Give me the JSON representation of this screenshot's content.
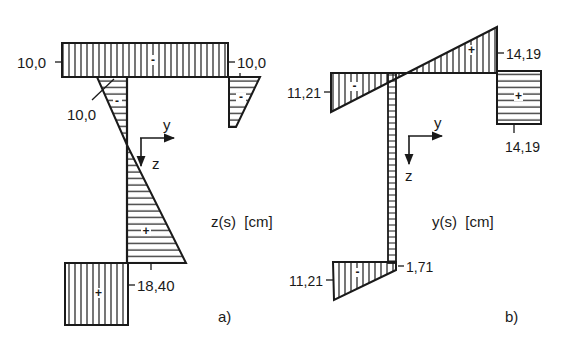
{
  "diagram_a": {
    "caption": "a)",
    "quantity_label": "z(s)  [cm]",
    "axes": {
      "y": "y",
      "z": "z"
    },
    "values": {
      "top_flange_left": "10,0",
      "top_flange_right": "10,0",
      "web_top": "10,0",
      "web_bottom": "18,40"
    },
    "signs": {
      "top_flange": "-",
      "web_top_triangle": "-",
      "right_lip": "-",
      "web_bottom_triangle": "+",
      "bottom_flange": "+"
    }
  },
  "diagram_b": {
    "caption": "b)",
    "quantity_label": "y(s)  [cm]",
    "axes": {
      "y": "y",
      "z": "z"
    },
    "values": {
      "top_flange_left": "11,21",
      "top_flange_right": "14,19",
      "right_lip_bottom": "14,19",
      "bottom_flange_left": "11,21",
      "bottom_flange_right": "1,71"
    },
    "signs": {
      "top_left_triangle": "-",
      "top_right_triangle": "+",
      "right_lip": "+",
      "bottom_flange": "-"
    }
  },
  "colors": {
    "ink": "#1a1a1a",
    "background": "#ffffff"
  }
}
